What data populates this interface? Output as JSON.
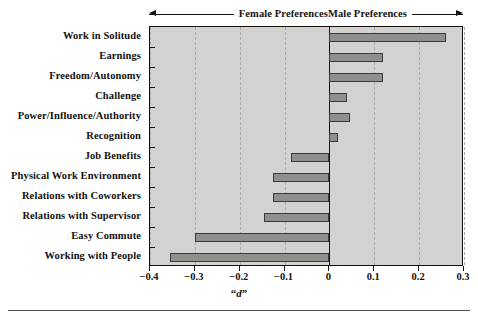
{
  "header": {
    "female_label": "Female Preferences",
    "male_label": "Male Preferences",
    "left_arrow_icon": "arrow-left-icon",
    "right_arrow_icon": "arrow-right-icon"
  },
  "axis": {
    "x_title_open_quote": "“",
    "x_title_letter": "d",
    "x_title_close_quote": "”",
    "x_title_full": "“d”",
    "tick_labels": [
      "−0.4",
      "−0.3",
      "−0.2",
      "−0.1",
      "0",
      "0.1",
      "0.2",
      "0.3"
    ]
  },
  "colors": {
    "plot_background": "#d2d2d0",
    "bar_fill": "#8f8f8c",
    "bar_border": "#3a3a38",
    "axis": "#15110f",
    "gridline": "#a9a9a6"
  },
  "chart_data": {
    "type": "bar",
    "orientation": "horizontal",
    "title": "",
    "subtitle": "",
    "xlabel": "“d”",
    "ylabel": "",
    "xlim": [
      -0.4,
      0.3
    ],
    "xticks": [
      -0.4,
      -0.3,
      -0.2,
      -0.1,
      0,
      0.1,
      0.2,
      0.3
    ],
    "xtick_labels": [
      "−0.4",
      "−0.3",
      "−0.2",
      "−0.1",
      "0",
      "0.1",
      "0.2",
      "0.3"
    ],
    "grid": true,
    "grid_axis": "x",
    "legend": "none",
    "annotations": [
      "Female Preferences",
      "Male Preferences"
    ],
    "categories": [
      "Work in Solitude",
      "Earnings",
      "Freedom/Autonomy",
      "Challenge",
      "Power/Influence/Authority",
      "Recognition",
      "Job Benefits",
      "Physical Work Environment",
      "Relations with Coworkers",
      "Relations with Supervisor",
      "Easy Commute",
      "Working with People"
    ],
    "values": [
      0.26,
      0.12,
      0.12,
      0.04,
      0.045,
      0.02,
      -0.085,
      -0.125,
      -0.125,
      -0.145,
      -0.3,
      -0.355
    ]
  }
}
